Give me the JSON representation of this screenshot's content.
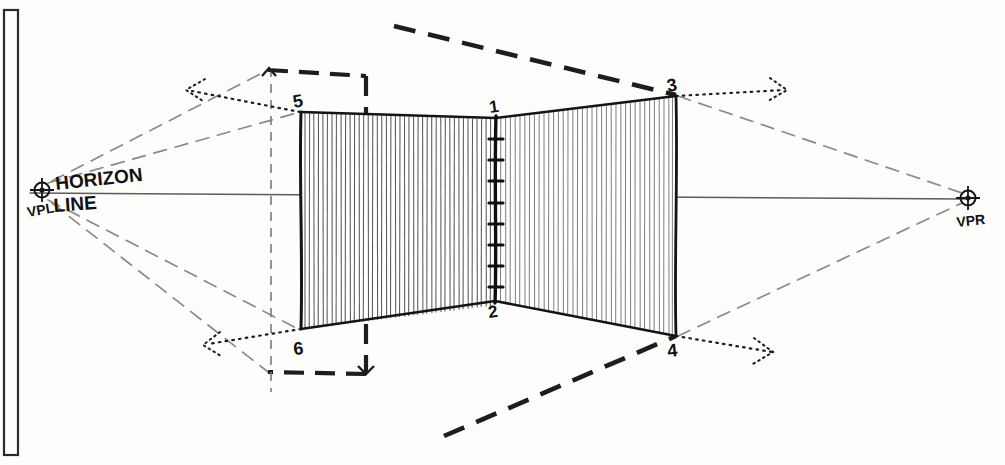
{
  "drawing": {
    "title": "Two-point perspective corner-wall construction sketch",
    "medium": "pencil on white paper",
    "paper_color": "#fdfdfc",
    "ink_color": "#1a1a1a",
    "light_ink_color": "#6f6f6f",
    "annotations": {
      "horizon_word_1": "HORIZON",
      "horizon_word_2": "LINE",
      "vp_left": "VPL",
      "vp_right": "VPR"
    },
    "point_labels": {
      "p1": "1",
      "p2": "2",
      "p3": "3",
      "p4": "4",
      "p5": "5",
      "p6": "6"
    },
    "geometry": {
      "horizon_y": 196,
      "vpl": {
        "x": 42,
        "y": 190,
        "label": "VPL"
      },
      "vpr": {
        "x": 968,
        "y": 198,
        "label": "VPR"
      },
      "corner_top": {
        "x": 496,
        "y": 118,
        "label": "1"
      },
      "corner_bottom": {
        "x": 495,
        "y": 301,
        "label": "2"
      },
      "right_top": {
        "x": 676,
        "y": 96,
        "label": "3"
      },
      "right_bottom": {
        "x": 676,
        "y": 336,
        "label": "4"
      },
      "left_top": {
        "x": 301,
        "y": 112,
        "label": "5"
      },
      "left_bottom": {
        "x": 301,
        "y": 329,
        "label": "6"
      },
      "tick_count": 8,
      "left_wall_hatch_count": 42,
      "right_wall_hatch_count": 38
    }
  },
  "page_frame": {
    "visible": true,
    "left_border_x": 6,
    "border_color": "#2b2b2b"
  }
}
